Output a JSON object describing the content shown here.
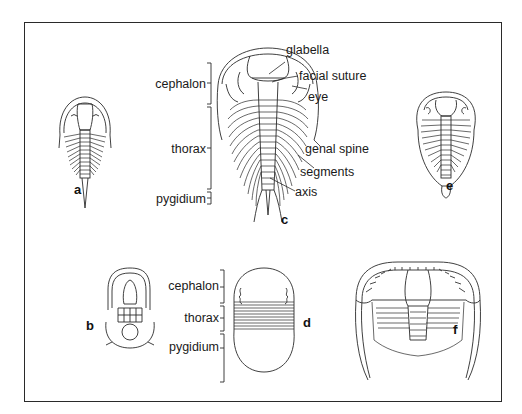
{
  "figure": {
    "specimens": [
      {
        "id": "a",
        "label": "a"
      },
      {
        "id": "b",
        "label": "b"
      },
      {
        "id": "c",
        "label": "c"
      },
      {
        "id": "d",
        "label": "d"
      },
      {
        "id": "e",
        "label": "e"
      },
      {
        "id": "f",
        "label": "f"
      }
    ],
    "specimen_c_labels": {
      "left": {
        "cephalon": "cephalon",
        "thorax": "thorax",
        "pygidium": "pygidium"
      },
      "right": {
        "glabella": "glabella",
        "facial_suture": "facial suture",
        "eye": "eye",
        "genal_spine": "genal spine",
        "segments": "segments",
        "axis": "axis"
      }
    },
    "specimen_d_labels": {
      "cephalon": "cephalon",
      "thorax": "thorax",
      "pygidium": "pygidium"
    }
  }
}
